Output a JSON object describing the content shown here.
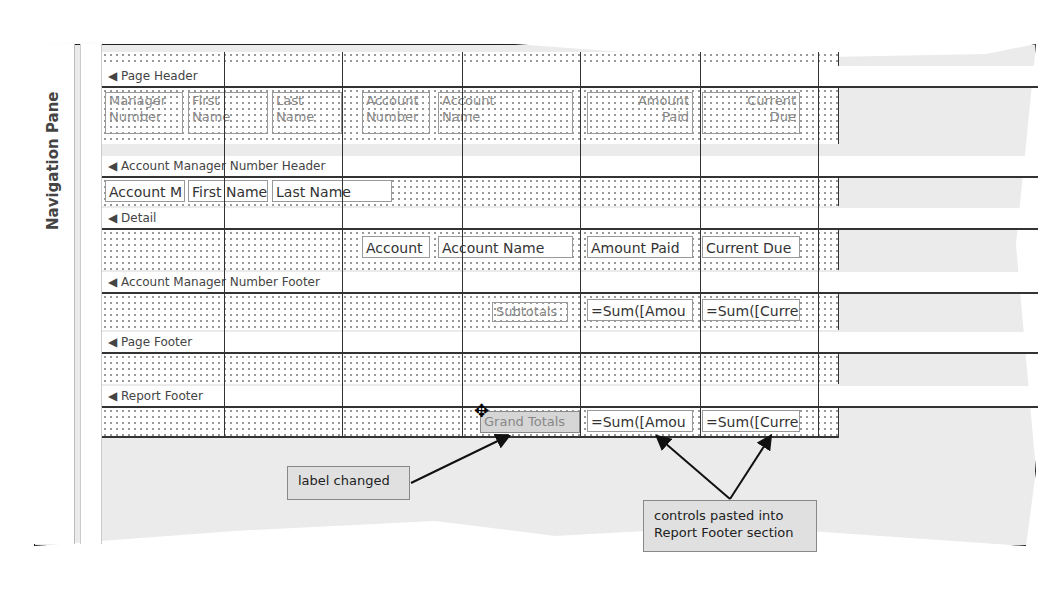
{
  "nav_pane": {
    "label": "Navigation Pane"
  },
  "ruler": {
    "marks": [
      "-",
      "-",
      "-",
      "-",
      "-",
      "-",
      "-",
      "-",
      "-",
      "-",
      "-",
      "-",
      "-",
      "1",
      "-"
    ]
  },
  "sections": {
    "page_header": "Page Header",
    "group_header": "Account Manager Number Header",
    "detail": "Detail",
    "group_footer": "Account Manager Number Footer",
    "page_footer": "Page Footer",
    "report_footer": "Report Footer"
  },
  "page_header_labels": [
    {
      "l1": "Manager",
      "l2": "Number"
    },
    {
      "l1": "First",
      "l2": "Name"
    },
    {
      "l1": "Last",
      "l2": "Name"
    },
    {
      "l1": "Account",
      "l2": "Number"
    },
    {
      "l1": "Account",
      "l2": "Name"
    },
    {
      "l1": "Amount",
      "l2": "Paid"
    },
    {
      "l1": "Current",
      "l2": "Due"
    }
  ],
  "group_header_controls": [
    "Account M",
    "First Name",
    "Last Name"
  ],
  "detail_controls": [
    "Account",
    "Account Name",
    "Amount Paid",
    "Current Due"
  ],
  "group_footer_controls": {
    "label": "Subtotals",
    "amount": "=Sum([Amou",
    "current": "=Sum([Curre"
  },
  "report_footer_controls": {
    "label": "Grand Totals",
    "amount": "=Sum([Amou",
    "current": "=Sum([Curre"
  },
  "callouts": {
    "label_changed": "label changed",
    "controls_pasted_1": "controls pasted into",
    "controls_pasted_2": "Report Footer section"
  }
}
